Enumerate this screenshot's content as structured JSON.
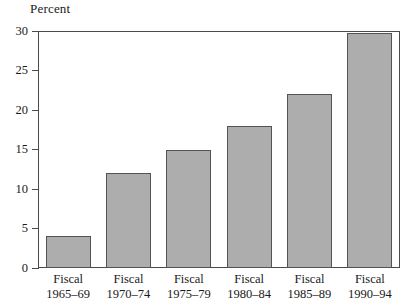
{
  "chart_data": {
    "type": "bar",
    "title": "",
    "subtitle": "",
    "ylabel": "Percent",
    "xlabel": "",
    "ylim": [
      0,
      30
    ],
    "yticks": [
      0,
      5,
      10,
      15,
      20,
      25,
      30
    ],
    "ytick_labels": [
      "0",
      "5",
      "10",
      "15",
      "20",
      "25",
      "30"
    ],
    "grid": false,
    "legend": null,
    "categories": [
      "Fiscal 1965–69",
      "Fiscal 1970–74",
      "Fiscal 1975–79",
      "Fiscal 1980–84",
      "Fiscal 1985–89",
      "Fiscal 1990–94"
    ],
    "category_lines": [
      {
        "line1": "Fiscal",
        "line2": "1965–69"
      },
      {
        "line1": "Fiscal",
        "line2": "1970–74"
      },
      {
        "line1": "Fiscal",
        "line2": "1975–79"
      },
      {
        "line1": "Fiscal",
        "line2": "1980–84"
      },
      {
        "line1": "Fiscal",
        "line2": "1985–89"
      },
      {
        "line1": "Fiscal",
        "line2": "1990–94"
      }
    ],
    "values": [
      4,
      12,
      15,
      18,
      22,
      29.8
    ],
    "bar_fill_color": "#adadad",
    "bar_edge_color": "#535353",
    "axis_color": "#4a4a4a",
    "background_color": "#ffffff"
  }
}
